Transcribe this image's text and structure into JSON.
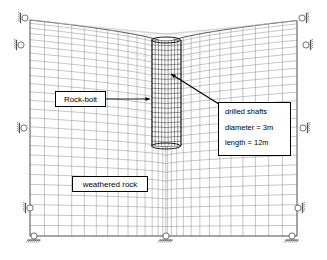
{
  "figure": {
    "type": "finite-element-mesh-diagram",
    "background_color": "#ffffff",
    "mesh_color": "#808080",
    "mesh_dark_color": "#333333",
    "annotation_color": "#000000",
    "bolt_color": "#c8c8c8",
    "width": 327,
    "height": 260
  },
  "annotations": {
    "rock_bolt": {
      "label": "Rock-bolt",
      "box": {
        "x": 55,
        "y": 91,
        "w": 51,
        "h": 16
      },
      "arrow": {
        "x1": 106,
        "y1": 99,
        "x2": 150,
        "y2": 99
      }
    },
    "drilled_shafts": {
      "title": "drilled shafts",
      "diameter": "diameter = 3m",
      "length": "length = 12m",
      "box": {
        "x": 218,
        "y": 102,
        "w": 73,
        "h": 54
      },
      "arrow": {
        "x1": 222,
        "y1": 106,
        "x2": 171,
        "y2": 74
      }
    },
    "weathered_rock": {
      "label": "weathered rock",
      "box": {
        "x": 72,
        "y": 176,
        "w": 76,
        "h": 16
      }
    }
  },
  "mesh": {
    "domain_top_left": {
      "x": 30,
      "y": 20
    },
    "domain_top_right": {
      "x": 297,
      "y": 20
    },
    "domain_bottom_left": {
      "x": 30,
      "y": 236
    },
    "domain_bottom_right": {
      "x": 297,
      "y": 236
    },
    "surface_dip_center_y": 44,
    "columns": 28,
    "rows": 26
  },
  "shaft": {
    "center_x": 166,
    "left_x": 152,
    "right_x": 181,
    "top_y": 40,
    "bottom_y": 146,
    "vertical_divisions": 9,
    "horizontal_divisions": 22
  },
  "supports": {
    "roller_horizontal_left": [
      {
        "x": 25,
        "y": 18
      },
      {
        "x": 21,
        "y": 45
      },
      {
        "x": 24,
        "y": 128
      },
      {
        "x": 30,
        "y": 208
      }
    ],
    "roller_horizontal_right": [
      {
        "x": 302,
        "y": 18
      },
      {
        "x": 306,
        "y": 45
      },
      {
        "x": 303,
        "y": 128
      },
      {
        "x": 298,
        "y": 208
      }
    ],
    "roller_vertical_bottom": [
      {
        "x": 34,
        "y": 240
      },
      {
        "x": 166,
        "y": 240
      },
      {
        "x": 292,
        "y": 240
      }
    ]
  }
}
